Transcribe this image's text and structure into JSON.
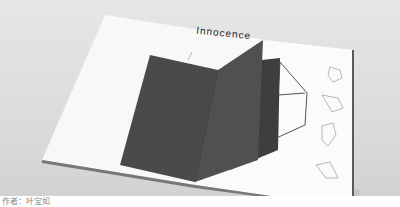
{
  "image": {
    "description": "Photograph of an open white booklet with a dark gray pop-up fold-out and line-drawn wireframe crystal shapes",
    "title_text": "Innocence",
    "caption": "作者：叶宝如",
    "colors": {
      "background": "#dcdcdc",
      "page": "#fafafa",
      "dark_insert": "#4a4a4a",
      "line_drawing": "#555555",
      "spine": "#6a6a6a"
    }
  }
}
